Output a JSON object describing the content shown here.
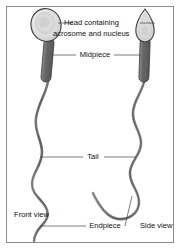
{
  "figure": {
    "background_color": "#ffffff",
    "border_color": "#8d8d8d",
    "outline_color": "#3a3a3a",
    "midpiece_color": "#6e6e6e",
    "head_fill_color": "#e8e8e8",
    "tail_color": "#777777"
  },
  "labels": {
    "head_line1": "Head containing",
    "head_line2": "acrosome and nucleus",
    "midpiece": "Midpiece",
    "tail": "Tail",
    "endpiece": "Endpiece",
    "front_view": "Front view",
    "side_view": "Side view"
  },
  "parts": [
    {
      "name": "head",
      "label": "Head containing acrosome and nucleus"
    },
    {
      "name": "midpiece",
      "label": "Midpiece"
    },
    {
      "name": "tail",
      "label": "Tail"
    },
    {
      "name": "endpiece",
      "label": "Endpiece"
    }
  ],
  "views": [
    {
      "name": "front-view",
      "label": "Front view",
      "head_shape": "oval"
    },
    {
      "name": "side-view",
      "label": "Side view",
      "head_shape": "teardrop"
    }
  ]
}
